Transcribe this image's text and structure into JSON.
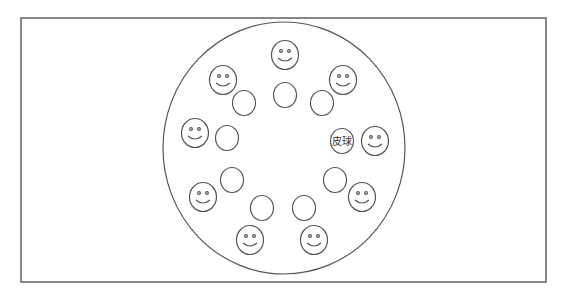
{
  "diagram": {
    "type": "circle-game-formation",
    "colors": {
      "stroke": "#555555",
      "frame": "#6a6a6a",
      "background": "#ffffff"
    },
    "frame": {
      "x": 21,
      "y": 18,
      "width": 525,
      "height": 264
    },
    "outer_circle": {
      "cx": 284,
      "cy": 148,
      "rx": 121,
      "ry": 126
    },
    "smiley_radius": 13.5,
    "seat_radius": 11.5,
    "ball_label": "皮球",
    "pairs": [
      {
        "position": "top",
        "smiley": {
          "x": 285,
          "y": 55
        },
        "seat": {
          "x": 285,
          "y": 95
        },
        "has_ball": false
      },
      {
        "position": "upper-right",
        "smiley": {
          "x": 343,
          "y": 80
        },
        "seat": {
          "x": 322,
          "y": 103
        },
        "has_ball": false
      },
      {
        "position": "right",
        "smiley": {
          "x": 375,
          "y": 141
        },
        "seat": {
          "x": 342,
          "y": 141
        },
        "has_ball": true
      },
      {
        "position": "lower-right",
        "smiley": {
          "x": 362,
          "y": 197
        },
        "seat": {
          "x": 335,
          "y": 180
        },
        "has_ball": false
      },
      {
        "position": "bottom-right",
        "smiley": {
          "x": 314,
          "y": 240
        },
        "seat": {
          "x": 304,
          "y": 208
        },
        "has_ball": false
      },
      {
        "position": "bottom-left",
        "smiley": {
          "x": 250,
          "y": 240
        },
        "seat": {
          "x": 262,
          "y": 208
        },
        "has_ball": false
      },
      {
        "position": "lower-left",
        "smiley": {
          "x": 203,
          "y": 197
        },
        "seat": {
          "x": 232,
          "y": 180
        },
        "has_ball": false
      },
      {
        "position": "left",
        "smiley": {
          "x": 195,
          "y": 133
        },
        "seat": {
          "x": 227,
          "y": 138
        },
        "has_ball": false
      },
      {
        "position": "upper-left",
        "smiley": {
          "x": 223,
          "y": 80
        },
        "seat": {
          "x": 244,
          "y": 103
        },
        "has_ball": false
      }
    ]
  }
}
